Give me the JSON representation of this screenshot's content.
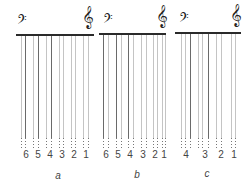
{
  "diagram": {
    "panels": [
      {
        "id": "a",
        "caption": "a",
        "bar": {
          "x": 16,
          "y": 34,
          "w": 78
        },
        "bass_clef": {
          "x": 17,
          "y": 14,
          "glyph": "𝄢"
        },
        "treble_clef": {
          "x": 82,
          "y": 6,
          "glyph": "𝄞"
        },
        "labels": [
          {
            "text": "6",
            "x": 26
          },
          {
            "text": "5",
            "x": 38
          },
          {
            "text": "4",
            "x": 50
          },
          {
            "text": "3",
            "x": 62
          },
          {
            "text": "2",
            "x": 74
          },
          {
            "text": "1",
            "x": 86
          }
        ],
        "caption_x": 58,
        "caption_y": 170,
        "lines": [
          {
            "x": 21,
            "dark": false
          },
          {
            "x": 25,
            "dark": true
          },
          {
            "x": 33,
            "dark": false
          },
          {
            "x": 38,
            "dark": true
          },
          {
            "x": 46,
            "dark": false
          },
          {
            "x": 51,
            "dark": true
          },
          {
            "x": 59,
            "dark": false
          },
          {
            "x": 63,
            "dark": false
          },
          {
            "x": 71,
            "dark": false
          },
          {
            "x": 75,
            "dark": false
          },
          {
            "x": 83,
            "dark": false
          },
          {
            "x": 88,
            "dark": false
          }
        ]
      },
      {
        "id": "b",
        "caption": "b",
        "bar": {
          "x": 99,
          "y": 33,
          "w": 67
        },
        "bass_clef": {
          "x": 103,
          "y": 13,
          "glyph": "𝄢"
        },
        "treble_clef": {
          "x": 156,
          "y": 5,
          "glyph": "𝄞"
        },
        "labels": [
          {
            "text": "6",
            "x": 106
          },
          {
            "text": "5",
            "x": 118
          },
          {
            "text": "4",
            "x": 130
          },
          {
            "text": "3",
            "x": 143
          },
          {
            "text": "2",
            "x": 155
          },
          {
            "text": "1",
            "x": 164
          }
        ],
        "caption_x": 137,
        "caption_y": 169,
        "lines": [
          {
            "x": 103,
            "dark": true
          },
          {
            "x": 108,
            "dark": false
          },
          {
            "x": 116,
            "dark": true
          },
          {
            "x": 121,
            "dark": false
          },
          {
            "x": 128,
            "dark": true
          },
          {
            "x": 133,
            "dark": false
          },
          {
            "x": 141,
            "dark": false
          },
          {
            "x": 146,
            "dark": false
          },
          {
            "x": 153,
            "dark": false
          },
          {
            "x": 157,
            "dark": false
          },
          {
            "x": 162,
            "dark": false
          },
          {
            "x": 165,
            "dark": false
          }
        ]
      },
      {
        "id": "c",
        "caption": "c",
        "bar": {
          "x": 175,
          "y": 32,
          "w": 66
        },
        "bass_clef": {
          "x": 179,
          "y": 12,
          "glyph": "𝄢"
        },
        "treble_clef": {
          "x": 230,
          "y": 4,
          "glyph": "𝄞"
        },
        "labels": [
          {
            "text": "4",
            "x": 186
          },
          {
            "text": "3",
            "x": 205
          },
          {
            "text": "2",
            "x": 221
          },
          {
            "text": "1",
            "x": 234
          }
        ],
        "caption_x": 207,
        "caption_y": 168,
        "lines": [
          {
            "x": 181,
            "dark": false
          },
          {
            "x": 185,
            "dark": false
          },
          {
            "x": 190,
            "dark": true
          },
          {
            "x": 198,
            "dark": false
          },
          {
            "x": 202,
            "dark": false
          },
          {
            "x": 208,
            "dark": true
          },
          {
            "x": 216,
            "dark": false
          },
          {
            "x": 221,
            "dark": false
          },
          {
            "x": 231,
            "dark": false
          },
          {
            "x": 235,
            "dark": false
          }
        ]
      }
    ],
    "colors": {
      "dark_line": "#6a6a6a",
      "light_line": "#c4c4c4",
      "bar": "#2a2a2a"
    }
  }
}
